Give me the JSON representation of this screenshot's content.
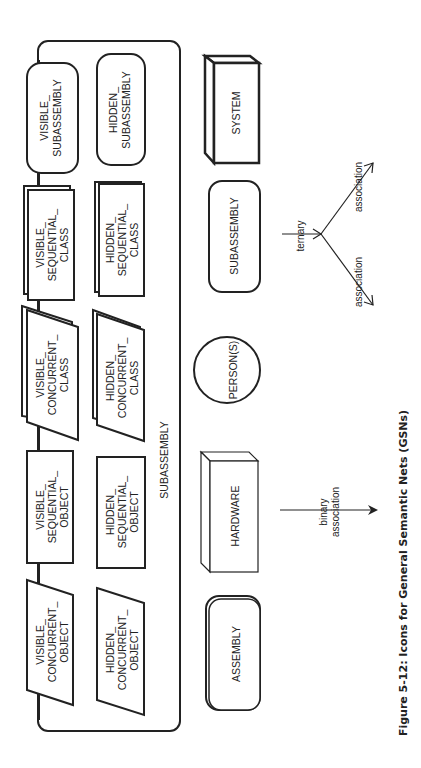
{
  "figure": {
    "caption": "Figure 5-12: Icons for General Semantic Nets (GSNs)",
    "orientation": "rotated 90 degrees counter-clockwise"
  },
  "container": {
    "label": "SUBASSEMBLY",
    "items": [
      {
        "id": "visible-subassembly",
        "line1": "VISIBLE_",
        "line2": "SUBASSEMBLY",
        "line3": ""
      },
      {
        "id": "hidden-subassembly",
        "line1": "HIDDEN_",
        "line2": "SUBASSEMBLY",
        "line3": ""
      },
      {
        "id": "visible-sequential-class",
        "line1": "VISIBLE_",
        "line2": "SEQUENTIAL_",
        "line3": "CLASS"
      },
      {
        "id": "hidden-sequential-class",
        "line1": "HIDDEN_",
        "line2": "SEQUENTIAL_",
        "line3": "CLASS"
      },
      {
        "id": "visible-concurrent-class",
        "line1": "VISIBLE_",
        "line2": "CONCURRENT_",
        "line3": "CLASS"
      },
      {
        "id": "hidden-concurrent-class",
        "line1": "HIDDEN_",
        "line2": "CONCURRENT_",
        "line3": "CLASS"
      },
      {
        "id": "visible-sequential-object",
        "line1": "VISIBLE_",
        "line2": "SEQUENTIAL_",
        "line3": "OBJECT"
      },
      {
        "id": "hidden-sequential-object",
        "line1": "HIDDEN_",
        "line2": "SEQUENTIAL_",
        "line3": "OBJECT"
      },
      {
        "id": "visible-concurrent-object",
        "line1": "VISIBLE_",
        "line2": "CONCURRENT_",
        "line3": "OBJECT"
      },
      {
        "id": "hidden-concurrent-object",
        "line1": "HIDDEN_",
        "line2": "CONCURRENT_",
        "line3": "OBJECT"
      }
    ]
  },
  "icons": {
    "system": "SYSTEM",
    "subassembly": "SUBASSEMBLY",
    "persons": "PERSON(S)",
    "hardware": "HARDWARE",
    "assembly": "ASSEMBLY"
  },
  "edges": {
    "binary_line1": "binary",
    "binary_line2": "association",
    "ternary": "ternary",
    "assoc_a": "association",
    "assoc_b": "association"
  }
}
